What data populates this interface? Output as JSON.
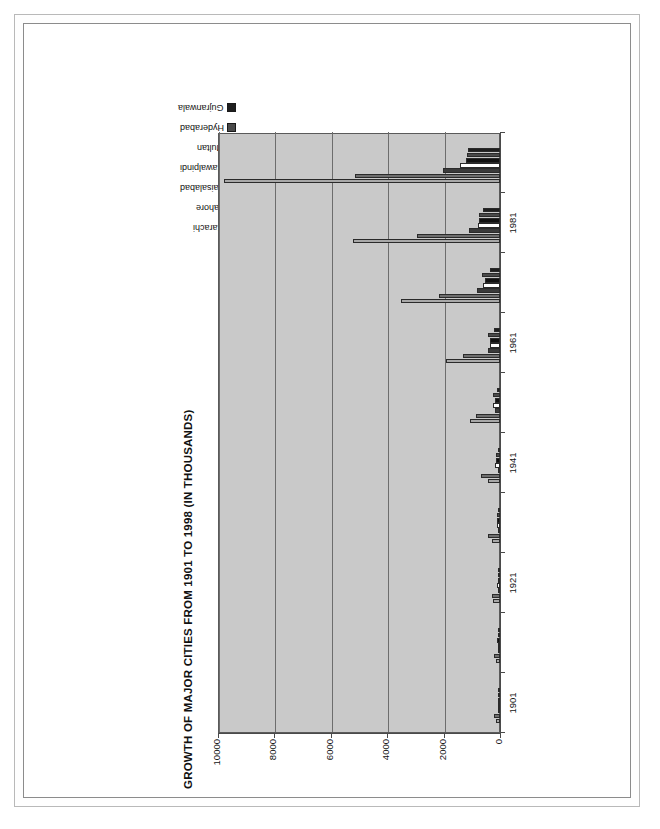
{
  "chart_data": {
    "type": "bar",
    "orientation": "horizontal",
    "title": "GROWTH OF MAJOR CITIES FROM 1901 TO 1998 (IN THOUSANDS)",
    "xlabel": "",
    "ylabel": "",
    "grid": true,
    "legend_position": "top-right",
    "value_axis_direction": "right-to-left",
    "ylim": [
      0,
      10000
    ],
    "yticks": [
      10000,
      8000,
      6000,
      4000,
      2000,
      0
    ],
    "ytick_labels": [
      "10000",
      "8000",
      "6000",
      "4000",
      "2000",
      "0"
    ],
    "categories": [
      "1901",
      "1911",
      "1921",
      "1931",
      "1941",
      "1951",
      "1961",
      "1972",
      "1981",
      "1998"
    ],
    "category_tick_labels": [
      "1901",
      "",
      "1921",
      "",
      "1941",
      "",
      "1961",
      "",
      "1981",
      ""
    ],
    "series": [
      {
        "name": "Karachi",
        "color": "#a8a8a8",
        "values": [
          137,
          152,
          244,
          300,
          435,
          1065,
          1913,
          3515,
          5208,
          9802
        ]
      },
      {
        "name": "Lahore",
        "color": "#6e6e6e",
        "values": [
          203,
          229,
          282,
          430,
          672,
          849,
          1296,
          2165,
          2952,
          5143
        ]
      },
      {
        "name": "Faisalabad",
        "color": "#3a3a3a",
        "values": [
          9,
          16,
          25,
          42,
          69,
          179,
          425,
          822,
          1104,
          2009
        ]
      },
      {
        "name": "Rawalpindi",
        "color": "#ffffff",
        "values": [
          88,
          87,
          101,
          119,
          185,
          237,
          340,
          615,
          795,
          1410
        ]
      },
      {
        "name": "Multan",
        "color": "#111111",
        "values": [
          87,
          99,
          85,
          119,
          142,
          190,
          358,
          544,
          732,
          1197
        ]
      },
      {
        "name": "Hyderabad",
        "color": "#4a4a4a",
        "values": [
          69,
          70,
          75,
          96,
          135,
          242,
          435,
          629,
          752,
          1167
        ]
      },
      {
        "name": "Gujranwala",
        "color": "#1f1f1f",
        "values": [
          29,
          30,
          35,
          47,
          85,
          121,
          196,
          360,
          601,
          1133
        ]
      }
    ]
  },
  "legend": {
    "items": [
      {
        "label": "Karachi"
      },
      {
        "label": "Lahore"
      },
      {
        "label": "Faisalabad"
      },
      {
        "label": "Rawalpindi"
      },
      {
        "label": "Multan"
      },
      {
        "label": "Hyderabad"
      },
      {
        "label": "Gujranwala"
      }
    ]
  }
}
